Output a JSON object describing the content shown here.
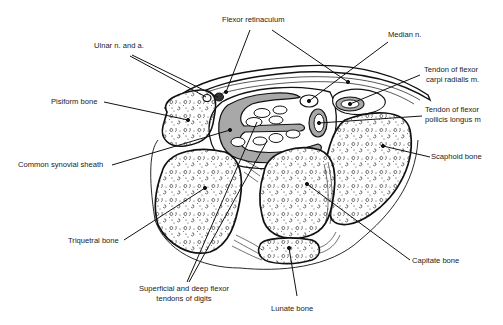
{
  "diagram": {
    "colors": {
      "background": "#ffffff",
      "line": "#111111",
      "sheath_fill": "#a8a8a8",
      "text": "#222222"
    },
    "labels": [
      {
        "id": "flexor-retinaculum",
        "text": "Flexor retinaculum",
        "x": 222,
        "y": 20
      },
      {
        "id": "median-n",
        "text": "Median n.",
        "x": 388,
        "y": 35
      },
      {
        "id": "ulnar-n-and-a",
        "text": "Ulnar n. and a.",
        "x": 94,
        "y": 46
      },
      {
        "id": "tendon-flexor-carpi-radialis",
        "line1": "Tendon of flexor",
        "line2": "carpi radialis m.",
        "x": 424,
        "y": 70
      },
      {
        "id": "pisiform-bone",
        "text": "Pisiform bone",
        "x": 51,
        "y": 97
      },
      {
        "id": "tendon-flexor-pollicis-longus",
        "line1": "Tendon of flexor",
        "line2": "pollicis longus m",
        "x": 425,
        "y": 110
      },
      {
        "id": "scaphoid-bone",
        "text": "Scaphoid bone",
        "x": 431,
        "y": 152
      },
      {
        "id": "common-synovial-sheath",
        "text": "Common synovial sheath",
        "x": 18,
        "y": 162
      },
      {
        "id": "triquetral-bone",
        "text": "Triquetral bone",
        "x": 68,
        "y": 237
      },
      {
        "id": "capitate-bone",
        "text": "Capitate bone",
        "x": 412,
        "y": 257
      },
      {
        "id": "superficial-deep-flexor-tendons",
        "line1": "Superficial and deep flexor",
        "line2": "tendons of digits",
        "x": 181,
        "y": 285
      },
      {
        "id": "lunate-bone",
        "text": "Lunate bone",
        "x": 271,
        "y": 301
      }
    ]
  }
}
